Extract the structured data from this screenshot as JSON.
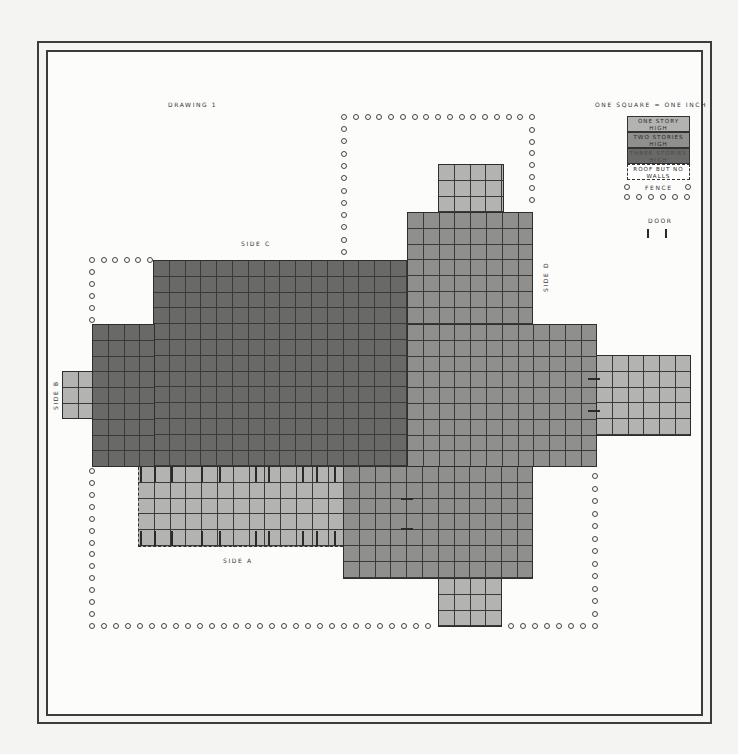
{
  "title": "DRAWING 1",
  "scale_note": "ONE SQUARE = ONE INCH",
  "legend": {
    "one_story": "ONE STORY HIGH",
    "two_stories": "TWO STORIES HIGH",
    "three_stories": "THREE STORIES HIGH",
    "roof_no_walls": "ROOF BUT NO WALLS",
    "fence": "FENCE",
    "door": "DOOR"
  },
  "sides": {
    "a": "SIDE A",
    "b": "SIDE B",
    "c": "SIDE C",
    "d": "SIDE D"
  },
  "colors": {
    "one_story": "#b3b3b1",
    "two_stories": "#8f8f8d",
    "three_stories": "#696968",
    "grid_line": "#3a3a3a"
  }
}
